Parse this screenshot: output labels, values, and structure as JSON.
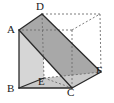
{
  "figure": {
    "kind": "geometry-diagram",
    "canvas": {
      "width": 114,
      "height": 103,
      "background": "#ffffff"
    },
    "style": {
      "solid_stroke": "#2b2b2b",
      "hidden_stroke": "#6e6e6e",
      "front_face_fill": "#d6d6d6",
      "diagonal_plane_fill": "#a8a8a8",
      "base_face_fill": "#c9c9c9",
      "right_wedge_fill": "#b5b5b5",
      "solid_stroke_width": 1.3,
      "hidden_stroke_width": 0.9,
      "hidden_dash": "2,2"
    },
    "vertices": [
      {
        "name": "A",
        "x": 19,
        "y": 30,
        "label_x": 7,
        "label_y": 24,
        "hidden": false
      },
      {
        "name": "B",
        "x": 19,
        "y": 88,
        "label_x": 7,
        "label_y": 83,
        "hidden": false
      },
      {
        "name": "C",
        "x": 72,
        "y": 88,
        "label_x": 67,
        "label_y": 87,
        "hidden": false
      },
      {
        "name": "D",
        "x": 42,
        "y": 14,
        "label_x": 36,
        "label_y": 1,
        "hidden": false
      },
      {
        "name": "E",
        "x": 44,
        "y": 78,
        "label_x": 38,
        "label_y": 76,
        "hidden": true
      },
      {
        "name": "F",
        "x": 101,
        "y": 72,
        "label_x": 96,
        "label_y": 65,
        "hidden": false
      }
    ],
    "hidden_corners": [
      {
        "name": "back-top-right",
        "x": 100,
        "y": 14
      },
      {
        "name": "back-top-left",
        "x": 42,
        "y": 14
      },
      {
        "name": "back-bottom-right",
        "x": 100,
        "y": 72
      }
    ],
    "faces": [
      {
        "name": "front-left-face",
        "points": "19,30 42,14 44,78 19,88",
        "fill": "#d6d6d6"
      },
      {
        "name": "diagonal-plane-ADFC",
        "points": "19,30 42,14 101,72 72,88",
        "fill": "#a8a8a8"
      },
      {
        "name": "base-face-BEFC",
        "points": "19,88 44,78 101,72 72,88",
        "fill": "#c9c9c9"
      }
    ],
    "solid_edges": [
      {
        "name": "edge-A-D",
        "x1": 19,
        "y1": 30,
        "x2": 42,
        "y2": 14
      },
      {
        "name": "edge-A-B",
        "x1": 19,
        "y1": 30,
        "x2": 19,
        "y2": 88
      },
      {
        "name": "edge-B-C",
        "x1": 19,
        "y1": 88,
        "x2": 72,
        "y2": 88
      },
      {
        "name": "edge-C-F",
        "x1": 72,
        "y1": 88,
        "x2": 101,
        "y2": 72
      },
      {
        "name": "edge-A-C",
        "x1": 19,
        "y1": 30,
        "x2": 72,
        "y2": 88
      },
      {
        "name": "edge-D-F",
        "x1": 42,
        "y1": 14,
        "x2": 101,
        "y2": 72
      },
      {
        "name": "edge-B-E",
        "x1": 19,
        "y1": 88,
        "x2": 44,
        "y2": 78
      }
    ],
    "hidden_edges": [
      {
        "name": "edge-D-backtopright",
        "x1": 42,
        "y1": 14,
        "x2": 100,
        "y2": 14
      },
      {
        "name": "edge-backtopright-F",
        "x1": 100,
        "y1": 14,
        "x2": 101,
        "y2": 72
      },
      {
        "name": "edge-D-E",
        "x1": 42,
        "y1": 14,
        "x2": 44,
        "y2": 78
      },
      {
        "name": "edge-E-F",
        "x1": 44,
        "y1": 78,
        "x2": 101,
        "y2": 72
      },
      {
        "name": "edge-E-C",
        "x1": 44,
        "y1": 78,
        "x2": 72,
        "y2": 88
      },
      {
        "name": "edge-C-backtop",
        "x1": 72,
        "y1": 88,
        "x2": 72,
        "y2": 30
      },
      {
        "name": "edge-backtop-topright",
        "x1": 72,
        "y1": 30,
        "x2": 100,
        "y2": 14
      },
      {
        "name": "edge-backtop-A",
        "x1": 72,
        "y1": 30,
        "x2": 19,
        "y2": 30
      }
    ]
  }
}
